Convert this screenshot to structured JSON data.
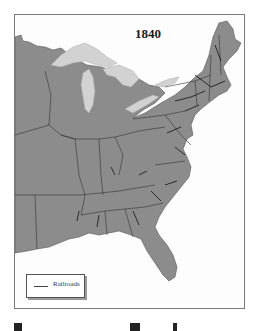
{
  "map": {
    "title": "1840",
    "legend": {
      "items": [
        {
          "symbol": "line",
          "label": "Railroads"
        }
      ]
    },
    "colors": {
      "land": "#8c8c8c",
      "lakes": "#d2d2d2",
      "water": "#fdfdfd",
      "borders": "#333333",
      "railroads": "#1e1e1e"
    }
  }
}
